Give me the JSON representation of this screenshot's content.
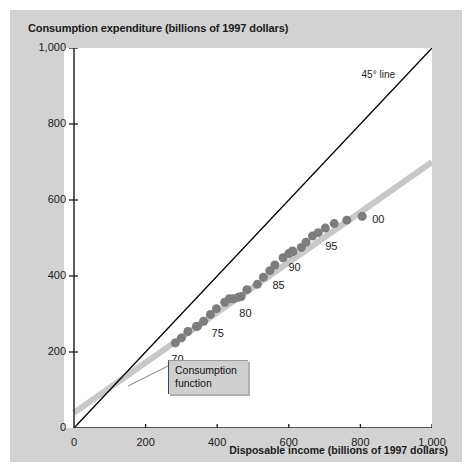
{
  "figure": {
    "background_color": "#d2d2d2",
    "plot_background_color": "#ffffff"
  },
  "callout": {
    "line1": "Consumption",
    "line2": "function"
  },
  "annotations": {
    "line45": "45° line"
  },
  "chart_data": {
    "type": "scatter",
    "title": "Consumption expenditure (billions of 1997 dollars)",
    "xlabel": "Disposable income (billions of 1997 dollars)",
    "ylabel": "Consumption expenditure (billions of 1997 dollars)",
    "xlim": [
      0,
      1000
    ],
    "ylim": [
      0,
      1000
    ],
    "xticks": [
      0,
      200,
      400,
      600,
      800,
      1000
    ],
    "yticks": [
      0,
      200,
      400,
      600,
      800,
      1000
    ],
    "xtick_labels": [
      "0",
      "200",
      "400",
      "600",
      "800",
      "1,000"
    ],
    "ytick_labels": [
      "0",
      "200",
      "400",
      "600",
      "800",
      "1,000"
    ],
    "grid": false,
    "legend": "none",
    "marker_color": "#7d7d7d",
    "marker_size": 9,
    "series": [
      {
        "name": "Consumption vs disposable income",
        "type": "scatter",
        "point_labels": [
          "70",
          "75",
          "80",
          "85",
          "90",
          "95",
          "00"
        ],
        "points": [
          {
            "year": "70",
            "x": 283,
            "y": 224,
            "label": "70"
          },
          {
            "year": "71",
            "x": 300,
            "y": 237
          },
          {
            "year": "72",
            "x": 318,
            "y": 254
          },
          {
            "year": "73",
            "x": 342,
            "y": 267
          },
          {
            "year": "74",
            "x": 345,
            "y": 268
          },
          {
            "year": "75",
            "x": 362,
            "y": 281,
            "label": "75"
          },
          {
            "year": "76",
            "x": 381,
            "y": 299
          },
          {
            "year": "77",
            "x": 398,
            "y": 314
          },
          {
            "year": "78",
            "x": 421,
            "y": 331
          },
          {
            "year": "79",
            "x": 434,
            "y": 340
          },
          {
            "year": "80",
            "x": 445,
            "y": 340,
            "label": "80"
          },
          {
            "year": "81",
            "x": 459,
            "y": 344
          },
          {
            "year": "82",
            "x": 467,
            "y": 346
          },
          {
            "year": "83",
            "x": 483,
            "y": 364
          },
          {
            "year": "84",
            "x": 512,
            "y": 378
          },
          {
            "year": "85",
            "x": 529,
            "y": 397,
            "label": "85"
          },
          {
            "year": "86",
            "x": 547,
            "y": 414
          },
          {
            "year": "87",
            "x": 561,
            "y": 429
          },
          {
            "year": "88",
            "x": 584,
            "y": 448
          },
          {
            "year": "89",
            "x": 600,
            "y": 459
          },
          {
            "year": "90",
            "x": 610,
            "y": 466,
            "label": "90"
          },
          {
            "year": "91",
            "x": 612,
            "y": 464
          },
          {
            "year": "92",
            "x": 635,
            "y": 475
          },
          {
            "year": "93",
            "x": 648,
            "y": 489
          },
          {
            "year": "94",
            "x": 666,
            "y": 505
          },
          {
            "year": "95",
            "x": 682,
            "y": 514,
            "label": "95"
          },
          {
            "year": "96",
            "x": 702,
            "y": 526
          },
          {
            "year": "97",
            "x": 727,
            "y": 538
          },
          {
            "year": "98",
            "x": 762,
            "y": 547
          },
          {
            "year": "00",
            "x": 805,
            "y": 557,
            "label": "00"
          }
        ]
      },
      {
        "name": "Consumption function",
        "type": "line",
        "color": "#c8c8c8",
        "from": {
          "x": 0,
          "y": 40
        },
        "to": {
          "x": 1000,
          "y": 700
        }
      },
      {
        "name": "45° line",
        "type": "line",
        "color": "#000000",
        "from": {
          "x": 0,
          "y": 0
        },
        "to": {
          "x": 1000,
          "y": 1000
        }
      }
    ]
  }
}
